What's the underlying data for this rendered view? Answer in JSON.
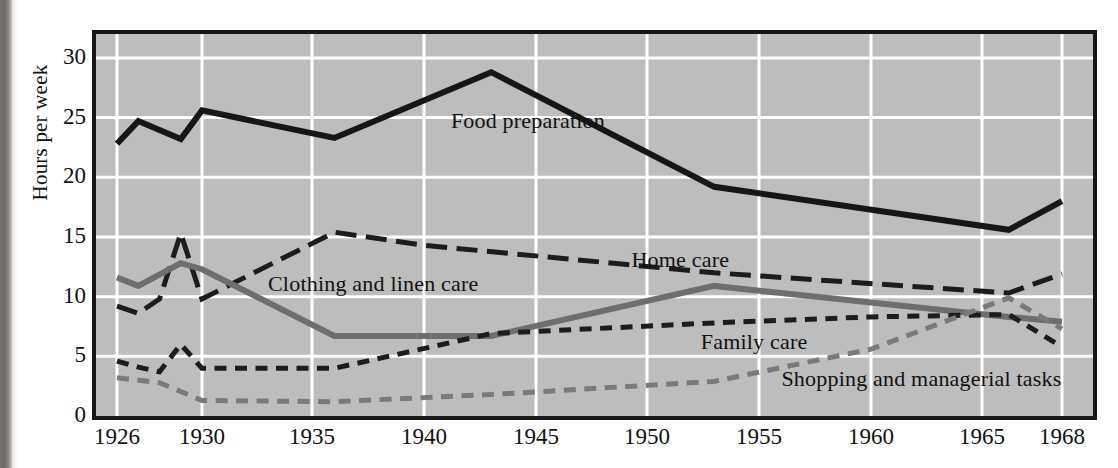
{
  "figure": {
    "ylabel": "Hours per week",
    "background_color": "#bdbdbd",
    "grid_color": "#ffffff",
    "frame_color": "#161616"
  },
  "chart_data": {
    "type": "line",
    "title": "",
    "xlabel": "",
    "ylabel": "Hours per week",
    "xlim": [
      1926,
      1968
    ],
    "ylim": [
      0,
      32
    ],
    "yticks": [
      0,
      5,
      10,
      15,
      20,
      25,
      30
    ],
    "xticks": [
      1926,
      1930,
      1935,
      1940,
      1945,
      1950,
      1955,
      1960,
      1965,
      1968
    ],
    "grid": true,
    "legend": "inline-annotations",
    "series": [
      {
        "name": "Food preparation",
        "color": "#161616",
        "style": "solid",
        "width": 6,
        "label_x": 1941.2,
        "label_y": 24.6,
        "x": [
          1926,
          1927,
          1929,
          1930,
          1936,
          1943,
          1953,
          1966,
          1968
        ],
        "y": [
          22.8,
          24.7,
          23.2,
          25.6,
          23.3,
          28.8,
          19.2,
          15.6,
          18.0
        ]
      },
      {
        "name": "Home care",
        "color": "#1c1c1c",
        "style": "long-dash",
        "width": 5,
        "label_x": 1949.3,
        "label_y": 13.0,
        "x": [
          1926,
          1927,
          1928,
          1929,
          1930,
          1936,
          1940,
          1953,
          1966,
          1968
        ],
        "y": [
          9.2,
          8.6,
          9.8,
          15.3,
          9.8,
          15.4,
          14.3,
          12.0,
          10.3,
          11.9
        ]
      },
      {
        "name": "Clothing and linen care",
        "color": "#6e6e6e",
        "style": "solid",
        "width": 6,
        "label_x": 1933.0,
        "label_y": 11.0,
        "x": [
          1926,
          1927,
          1929,
          1930,
          1936,
          1943,
          1953,
          1966,
          1968
        ],
        "y": [
          11.6,
          10.9,
          12.8,
          12.3,
          6.7,
          6.7,
          10.9,
          8.3,
          7.9
        ]
      },
      {
        "name": "Family care",
        "color": "#1c1c1c",
        "style": "short-dash",
        "width": 5,
        "label_x": 1952.4,
        "label_y": 6.1,
        "x": [
          1926,
          1927,
          1928,
          1929,
          1930,
          1936,
          1943,
          1953,
          1960,
          1966,
          1968
        ],
        "y": [
          4.6,
          4.1,
          3.7,
          6.0,
          4.0,
          4.0,
          6.9,
          7.8,
          8.3,
          8.5,
          5.8
        ]
      },
      {
        "name": "Shopping and managerial tasks",
        "color": "#7a7a7a",
        "style": "short-dash",
        "width": 5,
        "label_x": 1956.0,
        "label_y": 3.0,
        "x": [
          1926,
          1928,
          1930,
          1936,
          1943,
          1953,
          1960,
          1966,
          1968
        ],
        "y": [
          3.2,
          2.8,
          1.3,
          1.2,
          1.8,
          2.9,
          5.6,
          9.9,
          7.3
        ]
      }
    ]
  }
}
